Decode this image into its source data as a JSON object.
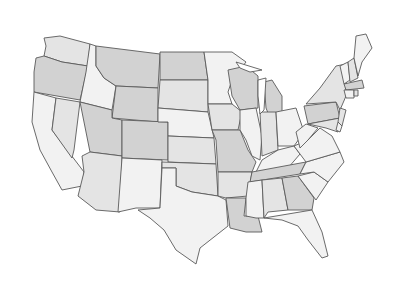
{
  "map": {
    "title": "",
    "type": "choropleth",
    "region": "Contiguous United States",
    "shades": {
      "light": "#f2f2f2",
      "medium": "#e4e4e4",
      "dark": "#d2d2d2",
      "border": "#5a5a5a",
      "background": "#ffffff"
    },
    "states": [
      {
        "id": "WA",
        "shade": "medium",
        "points": "44,38 60,36 90,44 88,66 62,62 44,56 46,46"
      },
      {
        "id": "OR",
        "shade": "dark",
        "points": "36,58 44,56 62,62 88,66 80,100 34,92 34,72"
      },
      {
        "id": "CA",
        "shade": "light",
        "points": "34,92 56,98 52,130 84,172 82,186 62,190 52,172 40,150 32,122"
      },
      {
        "id": "NV",
        "shade": "medium",
        "points": "56,98 80,102 74,150 72,158 52,130"
      },
      {
        "id": "ID",
        "shade": "light",
        "points": "90,44 96,46 96,66 104,78 116,86 112,110 80,102 86,72"
      },
      {
        "id": "MT",
        "shade": "dark",
        "points": "96,46 160,54 158,88 116,86 104,78 96,66"
      },
      {
        "id": "WY",
        "shade": "dark",
        "points": "116,86 158,88 158,122 112,118"
      },
      {
        "id": "UT",
        "shade": "dark",
        "points": "80,102 112,110 112,118 122,120 122,156 90,152"
      },
      {
        "id": "AZ",
        "shade": "medium",
        "points": "82,156 90,152 122,156 120,212 96,210 78,196 84,172"
      },
      {
        "id": "CO",
        "shade": "dark",
        "points": "122,120 168,122 168,160 122,158"
      },
      {
        "id": "NM",
        "shade": "light",
        "points": "122,158 162,160 160,208 136,208 118,212"
      },
      {
        "id": "ND",
        "shade": "dark",
        "points": "160,52 204,52 208,80 160,80"
      },
      {
        "id": "SD",
        "shade": "medium",
        "points": "160,80 208,80 208,112 158,108"
      },
      {
        "id": "NE",
        "shade": "light",
        "points": "158,108 208,112 214,138 168,136 168,122 158,122"
      },
      {
        "id": "KS",
        "shade": "medium",
        "points": "168,136 214,138 216,164 168,162"
      },
      {
        "id": "OK",
        "shade": "medium",
        "points": "162,162 216,164 218,196 192,192 176,186 176,168 162,168"
      },
      {
        "id": "TX",
        "shade": "light",
        "points": "162,168 176,168 176,186 192,192 218,196 226,200 228,226 200,248 196,264 176,250 164,230 150,218 138,210 160,208"
      },
      {
        "id": "MN",
        "shade": "light",
        "points": "204,52 232,52 246,62 232,80 228,92 232,104 208,104 208,80"
      },
      {
        "id": "IA",
        "shade": "medium",
        "points": "208,104 232,104 242,112 238,130 212,130"
      },
      {
        "id": "MO",
        "shade": "dark",
        "points": "212,130 240,130 248,150 256,162 252,172 218,172 216,140"
      },
      {
        "id": "AR",
        "shade": "medium",
        "points": "218,172 252,172 248,196 226,198 218,196"
      },
      {
        "id": "LA",
        "shade": "dark",
        "points": "226,198 246,198 244,216 258,216 262,232 246,232 230,228"
      },
      {
        "id": "WI",
        "shade": "dark",
        "points": "228,70 246,66 258,76 258,108 240,110 232,96"
      },
      {
        "id": "IL",
        "shade": "light",
        "points": "240,110 256,108 262,136 260,160 252,156 246,140 240,130"
      },
      {
        "id": "MI",
        "shade": "dark",
        "points": "264,82 272,80 282,96 282,116 270,118 266,108"
      },
      {
        "id": "IN",
        "shade": "medium",
        "points": "260,112 276,112 278,150 262,156"
      },
      {
        "id": "OH",
        "shade": "light",
        "points": "276,112 296,108 304,132 294,146 278,146"
      },
      {
        "id": "KY",
        "shade": "light",
        "points": "262,160 278,150 294,146 300,154 288,168 256,172"
      },
      {
        "id": "TN",
        "shade": "dark",
        "points": "252,172 306,162 300,174 250,182"
      },
      {
        "id": "MS",
        "shade": "light",
        "points": "248,182 262,180 264,218 256,218 246,216 246,198"
      },
      {
        "id": "AL",
        "shade": "medium",
        "points": "262,180 282,178 288,210 268,212 264,218"
      },
      {
        "id": "GA",
        "shade": "dark",
        "points": "282,178 298,176 314,198 312,210 288,210"
      },
      {
        "id": "FL",
        "shade": "light",
        "points": "264,218 312,210 322,232 328,256 322,258 308,240 298,226 282,220"
      },
      {
        "id": "SC",
        "shade": "light",
        "points": "298,176 314,172 328,182 316,200"
      },
      {
        "id": "NC",
        "shade": "light",
        "points": "300,174 306,162 340,152 344,162 328,182 314,172"
      },
      {
        "id": "VA",
        "shade": "light",
        "points": "294,146 308,140 320,128 332,136 340,152 306,162 300,154"
      },
      {
        "id": "WV",
        "shade": "light",
        "points": "296,132 306,124 318,128 308,140 300,148"
      },
      {
        "id": "PA",
        "shade": "dark",
        "points": "304,106 336,102 340,118 308,124"
      },
      {
        "id": "NY",
        "shade": "medium",
        "points": "306,104 320,88 336,66 346,64 346,96 340,110 336,102"
      },
      {
        "id": "MD",
        "shade": "medium",
        "points": "308,124 340,118 338,132 326,128"
      },
      {
        "id": "NJ",
        "shade": "medium",
        "points": "340,108 346,110 342,126 338,122"
      },
      {
        "id": "DE",
        "shade": "light",
        "points": "338,122 342,126 340,132 336,130"
      },
      {
        "id": "VT",
        "shade": "light",
        "points": "340,66 348,62 350,80 344,84"
      },
      {
        "id": "NH",
        "shade": "medium",
        "points": "348,62 354,58 358,78 350,82"
      },
      {
        "id": "ME",
        "shade": "light",
        "points": "354,58 356,36 366,34 372,48 362,62 358,76"
      },
      {
        "id": "MA",
        "shade": "dark",
        "points": "344,84 362,80 364,88 346,90"
      },
      {
        "id": "CT",
        "shade": "light",
        "points": "344,90 354,90 354,98 346,98"
      },
      {
        "id": "RI",
        "shade": "medium",
        "points": "354,90 358,90 358,96 354,96"
      }
    ],
    "lakes": [
      {
        "id": "lake-michigan",
        "points": "258,80 266,78 264,110 260,114 258,96"
      },
      {
        "id": "lake-superior",
        "points": "236,62 262,70 250,72 240,68"
      }
    ]
  }
}
